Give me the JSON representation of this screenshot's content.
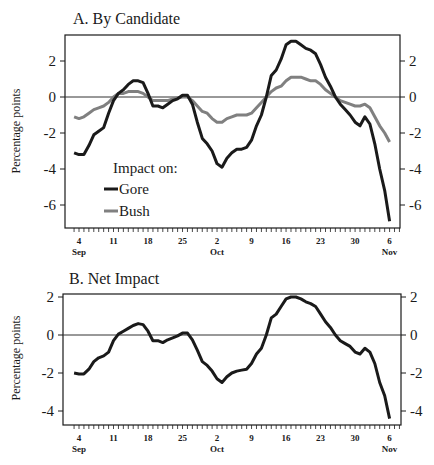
{
  "figure": {
    "panel_a_title": "A. By Candidate",
    "panel_b_title": "B. Net Impact",
    "ylabel": "Percentage points",
    "legend_title": "Impact on:",
    "legend_items": [
      {
        "label": "Gore",
        "color": "#1a1a1a"
      },
      {
        "label": "Bush",
        "color": "#808080"
      }
    ],
    "x_ticks": [
      "4",
      "11",
      "18",
      "25",
      "2",
      "9",
      "16",
      "23",
      "30",
      "6"
    ],
    "x_months": {
      "sep": "Sep",
      "oct": "Oct",
      "nov": "Nov"
    },
    "panel_a_yticks": [
      "2",
      "0",
      "-2",
      "-4",
      "-6"
    ],
    "panel_b_yticks": [
      "2",
      "0",
      "-2",
      "-4"
    ]
  },
  "chart_data": [
    {
      "type": "line",
      "title": "A. By Candidate",
      "xlabel": "",
      "ylabel": "Percentage points",
      "ylim": [
        -7.3,
        3.4
      ],
      "grid": false,
      "reference_line": 0,
      "legend": {
        "title": "Impact on:",
        "entries": [
          "Gore",
          "Bush"
        ],
        "position": "lower-left"
      },
      "x_tick_labels": [
        "4 Sep",
        "11",
        "18",
        "25",
        "2 Oct",
        "9",
        "16",
        "23",
        "30",
        "6 Nov"
      ],
      "x": [
        "Sep 3",
        "Sep 4",
        "Sep 5",
        "Sep 6",
        "Sep 7",
        "Sep 8",
        "Sep 9",
        "Sep 10",
        "Sep 11",
        "Sep 12",
        "Sep 13",
        "Sep 14",
        "Sep 15",
        "Sep 16",
        "Sep 17",
        "Sep 18",
        "Sep 19",
        "Sep 20",
        "Sep 21",
        "Sep 22",
        "Sep 23",
        "Sep 24",
        "Sep 25",
        "Sep 26",
        "Sep 27",
        "Sep 28",
        "Sep 29",
        "Sep 30",
        "Oct 1",
        "Oct 2",
        "Oct 3",
        "Oct 4",
        "Oct 5",
        "Oct 6",
        "Oct 7",
        "Oct 8",
        "Oct 9",
        "Oct 10",
        "Oct 11",
        "Oct 12",
        "Oct 13",
        "Oct 14",
        "Oct 15",
        "Oct 16",
        "Oct 17",
        "Oct 18",
        "Oct 19",
        "Oct 20",
        "Oct 21",
        "Oct 22",
        "Oct 23",
        "Oct 24",
        "Oct 25",
        "Oct 26",
        "Oct 27",
        "Oct 28",
        "Oct 29",
        "Oct 30",
        "Oct 31",
        "Nov 1",
        "Nov 2",
        "Nov 3",
        "Nov 4",
        "Nov 5",
        "Nov 6"
      ],
      "series": [
        {
          "name": "Gore",
          "color": "#1a1a1a",
          "values": [
            -3.1,
            -3.2,
            -3.2,
            -2.7,
            -2.1,
            -1.9,
            -1.7,
            -0.9,
            -0.2,
            0.2,
            0.4,
            0.7,
            0.9,
            0.9,
            0.8,
            0.2,
            -0.5,
            -0.5,
            -0.6,
            -0.4,
            -0.2,
            -0.1,
            0.1,
            0.1,
            -0.4,
            -1.4,
            -2.3,
            -2.6,
            -3.0,
            -3.7,
            -3.9,
            -3.4,
            -3.1,
            -2.9,
            -2.9,
            -2.8,
            -2.4,
            -1.6,
            -1.0,
            0.0,
            1.2,
            1.5,
            2.1,
            2.9,
            3.1,
            3.1,
            2.9,
            2.7,
            2.6,
            2.4,
            1.8,
            1.1,
            0.6,
            0.0,
            -0.4,
            -0.7,
            -1.0,
            -1.4,
            -1.6,
            -1.1,
            -1.5,
            -2.6,
            -4.0,
            -5.2,
            -6.9
          ]
        },
        {
          "name": "Bush",
          "color": "#808080",
          "values": [
            -1.1,
            -1.2,
            -1.1,
            -0.9,
            -0.7,
            -0.6,
            -0.5,
            -0.3,
            0.0,
            0.2,
            0.2,
            0.3,
            0.3,
            0.3,
            0.2,
            0.0,
            -0.2,
            -0.2,
            -0.2,
            -0.2,
            -0.1,
            -0.05,
            0.0,
            0.0,
            -0.2,
            -0.5,
            -0.8,
            -0.9,
            -1.2,
            -1.4,
            -1.4,
            -1.2,
            -1.1,
            -1.0,
            -1.0,
            -1.0,
            -0.9,
            -0.6,
            -0.3,
            0.0,
            0.3,
            0.5,
            0.6,
            0.9,
            1.1,
            1.1,
            1.1,
            1.0,
            0.9,
            0.9,
            0.7,
            0.4,
            0.2,
            0.0,
            -0.2,
            -0.3,
            -0.4,
            -0.5,
            -0.5,
            -0.4,
            -0.6,
            -1.1,
            -1.6,
            -2.0,
            -2.5
          ]
        }
      ]
    },
    {
      "type": "line",
      "title": "B. Net Impact",
      "xlabel": "",
      "ylabel": "Percentage points",
      "ylim": [
        -4.7,
        2.2
      ],
      "grid": false,
      "reference_line": 0,
      "x_tick_labels": [
        "4 Sep",
        "11",
        "18",
        "25",
        "2 Oct",
        "9",
        "16",
        "23",
        "30",
        "6 Nov"
      ],
      "x": [
        "Sep 3",
        "Sep 4",
        "Sep 5",
        "Sep 6",
        "Sep 7",
        "Sep 8",
        "Sep 9",
        "Sep 10",
        "Sep 11",
        "Sep 12",
        "Sep 13",
        "Sep 14",
        "Sep 15",
        "Sep 16",
        "Sep 17",
        "Sep 18",
        "Sep 19",
        "Sep 20",
        "Sep 21",
        "Sep 22",
        "Sep 23",
        "Sep 24",
        "Sep 25",
        "Sep 26",
        "Sep 27",
        "Sep 28",
        "Sep 29",
        "Sep 30",
        "Oct 1",
        "Oct 2",
        "Oct 3",
        "Oct 4",
        "Oct 5",
        "Oct 6",
        "Oct 7",
        "Oct 8",
        "Oct 9",
        "Oct 10",
        "Oct 11",
        "Oct 12",
        "Oct 13",
        "Oct 14",
        "Oct 15",
        "Oct 16",
        "Oct 17",
        "Oct 18",
        "Oct 19",
        "Oct 20",
        "Oct 21",
        "Oct 22",
        "Oct 23",
        "Oct 24",
        "Oct 25",
        "Oct 26",
        "Oct 27",
        "Oct 28",
        "Oct 29",
        "Oct 30",
        "Oct 31",
        "Nov 1",
        "Nov 2",
        "Nov 3",
        "Nov 4",
        "Nov 5",
        "Nov 6"
      ],
      "series": [
        {
          "name": "Net Impact",
          "color": "#1a1a1a",
          "values": [
            -2.0,
            -2.05,
            -2.05,
            -1.8,
            -1.4,
            -1.2,
            -1.1,
            -0.9,
            -0.3,
            0.05,
            0.2,
            0.35,
            0.5,
            0.6,
            0.55,
            0.2,
            -0.3,
            -0.3,
            -0.4,
            -0.25,
            -0.15,
            -0.05,
            0.1,
            0.1,
            -0.25,
            -0.8,
            -1.4,
            -1.6,
            -1.9,
            -2.3,
            -2.5,
            -2.2,
            -2.0,
            -1.9,
            -1.85,
            -1.8,
            -1.5,
            -1.0,
            -0.7,
            0.0,
            0.9,
            1.1,
            1.5,
            1.9,
            2.0,
            2.0,
            1.9,
            1.75,
            1.65,
            1.5,
            1.1,
            0.7,
            0.4,
            0.0,
            -0.3,
            -0.45,
            -0.6,
            -0.9,
            -1.0,
            -0.7,
            -0.9,
            -1.5,
            -2.5,
            -3.2,
            -4.4
          ]
        }
      ]
    }
  ]
}
